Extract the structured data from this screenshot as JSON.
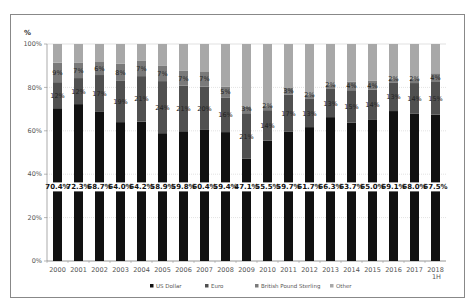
{
  "chart_data": {
    "type": "bar",
    "stacked": true,
    "ylabel": "%",
    "xlabel": "",
    "ylim": [
      0,
      100
    ],
    "yticks": [
      "0%",
      "20%",
      "40%",
      "60%",
      "80%",
      "100%"
    ],
    "grid": true,
    "legend_position": "bottom",
    "categories": [
      "2000",
      "2001",
      "2002",
      "2003",
      "2004",
      "2005",
      "2006",
      "2007",
      "2008",
      "2009",
      "2010",
      "2011",
      "2012",
      "2013",
      "2014",
      "2015",
      "2016",
      "2017",
      "2018 1H"
    ],
    "series": [
      {
        "name": "US Dollar",
        "color": "#111111",
        "values": [
          70.4,
          72.3,
          68.7,
          64.0,
          64.2,
          58.9,
          59.8,
          60.4,
          59.4,
          47.1,
          55.5,
          59.7,
          61.7,
          66.3,
          63.7,
          65.0,
          69.1,
          68.0,
          67.5
        ]
      },
      {
        "name": "Euro",
        "color": "#505050",
        "values": [
          12,
          12,
          17,
          19,
          21,
          24,
          21,
          20,
          16,
          21,
          14,
          17,
          13,
          13,
          15,
          14,
          13,
          14,
          15
        ]
      },
      {
        "name": "British Pound Sterling",
        "color": "#7a7a7a",
        "values": [
          9,
          7,
          6,
          8,
          7,
          7,
          7,
          7,
          5,
          3,
          2,
          3,
          2,
          2,
          4,
          4,
          2,
          2,
          4
        ]
      },
      {
        "name": "Other",
        "color": "#a8a8a8",
        "values": [
          8.6,
          8.7,
          8.3,
          9.0,
          7.8,
          10.1,
          12.2,
          12.6,
          19.6,
          28.9,
          28.5,
          20.3,
          23.3,
          18.7,
          17.3,
          17.0,
          15.9,
          16.0,
          13.5
        ]
      }
    ],
    "value_labels": {
      "US Dollar": [
        "70.4%",
        "72.3%",
        "68.7%",
        "64.0%",
        "64.2%",
        "58.9%",
        "59.8%",
        "60.4%",
        "59.4%",
        "47.1%",
        "55.5%",
        "59.7%",
        "61.7%",
        "66.3%",
        "63.7%",
        "65.0%",
        "69.1%",
        "68.0%",
        "67.5%"
      ],
      "Euro": [
        "12%",
        "12%",
        "17%",
        "19%",
        "21%",
        "24%",
        "21%",
        "20%",
        "16%",
        "21%",
        "14%",
        "17%",
        "13%",
        "13%",
        "15%",
        "14%",
        "13%",
        "14%",
        "15%"
      ],
      "British Pound Sterling": [
        "9%",
        "7%",
        "6%",
        "8%",
        "7%",
        "7%",
        "7%",
        "7%",
        "5%",
        "3%",
        "2%",
        "3%",
        "2%",
        "2%",
        "4%",
        "4%",
        "2%",
        "2%",
        "4%"
      ]
    },
    "legend": [
      "US Dollar",
      "Euro",
      "British Pound Sterling",
      "Other"
    ]
  },
  "legend_labels": [
    "US Dollar",
    "Euro",
    "British Pound Sterling",
    "Other"
  ]
}
